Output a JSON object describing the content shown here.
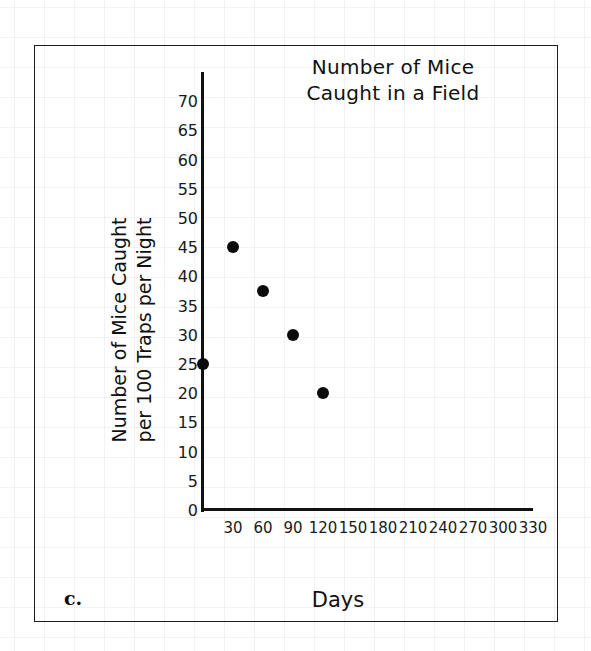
{
  "part_label": "c.",
  "chart_data": {
    "type": "scatter",
    "title": "Number of Mice Caught in a Field",
    "title_lines": [
      "Number of Mice",
      "Caught in a Field"
    ],
    "xlabel": "Days",
    "ylabel": "Number of Mice Caught per 100 Traps per Night",
    "ylabel_lines": [
      "Number of Mice Caught",
      "per 100 Traps per Night"
    ],
    "xlim": [
      0,
      345
    ],
    "ylim": [
      0,
      73
    ],
    "xticks": [
      30,
      60,
      90,
      120,
      150,
      180,
      210,
      240,
      270,
      300,
      330
    ],
    "yticks": [
      0,
      5,
      10,
      15,
      20,
      25,
      30,
      35,
      40,
      45,
      50,
      55,
      60,
      65,
      70
    ],
    "grid": false,
    "legend": "none",
    "marker_color": "#0b0b0b",
    "points": [
      {
        "x": 0,
        "y": 25
      },
      {
        "x": 30,
        "y": 45
      },
      {
        "x": 60,
        "y": 37.5
      },
      {
        "x": 90,
        "y": 30
      },
      {
        "x": 120,
        "y": 20
      }
    ]
  }
}
